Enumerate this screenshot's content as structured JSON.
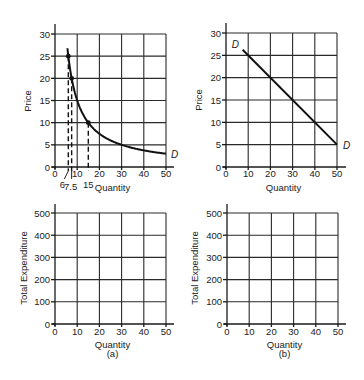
{
  "chart_data": [
    {
      "id": "top-a",
      "type": "line",
      "xlabel": "Quantity",
      "ylabel": "Price",
      "xlim": [
        0,
        50
      ],
      "ylim": [
        0,
        30
      ],
      "xticks": [
        "0",
        "10",
        "20",
        "30",
        "40",
        "50"
      ],
      "yticks": [
        "0",
        "5",
        "10",
        "15",
        "20",
        "25",
        "30"
      ],
      "grid": true,
      "series": [
        {
          "name": "D",
          "label": "D",
          "description": "P = 150 / Q",
          "x": [
            5.6,
            6,
            7.5,
            10,
            15,
            20,
            25,
            30,
            40,
            50
          ],
          "y": [
            26.8,
            25,
            20,
            15,
            10,
            7.5,
            6,
            5,
            3.75,
            3
          ]
        }
      ],
      "marked_points": [
        {
          "x": 6,
          "y": 25
        },
        {
          "x": 7.5,
          "y": 20
        },
        {
          "x": 15,
          "y": 10
        }
      ],
      "annotations": [
        "6",
        "7.5",
        "15"
      ]
    },
    {
      "id": "top-b",
      "type": "line",
      "xlabel": "Quantity",
      "ylabel": "Price",
      "xlim": [
        0,
        50
      ],
      "ylim": [
        0,
        30
      ],
      "xticks": [
        "0",
        "10",
        "20",
        "30",
        "40",
        "50"
      ],
      "yticks": [
        "0",
        "5",
        "10",
        "15",
        "20",
        "25",
        "30"
      ],
      "grid": true,
      "series": [
        {
          "name": "D",
          "label_start": "D",
          "label_end": "D",
          "description": "P = 30 - 0.5Q",
          "x": [
            7.5,
            50
          ],
          "y": [
            26.25,
            5
          ]
        }
      ]
    },
    {
      "id": "bottom-a",
      "type": "line",
      "xlabel": "Quantity",
      "sublabel": "(a)",
      "ylabel": "Total Expenditure",
      "xlim": [
        0,
        50
      ],
      "ylim": [
        0,
        500
      ],
      "xticks": [
        "0",
        "10",
        "20",
        "30",
        "40",
        "50"
      ],
      "yticks": [
        "0",
        "100",
        "200",
        "300",
        "400",
        "500"
      ],
      "grid": true,
      "series": []
    },
    {
      "id": "bottom-b",
      "type": "line",
      "xlabel": "Quantity",
      "sublabel": "(b)",
      "ylabel": "Total Expenditure",
      "xlim": [
        0,
        50
      ],
      "ylim": [
        0,
        500
      ],
      "xticks": [
        "0",
        "10",
        "20",
        "30",
        "40",
        "50"
      ],
      "yticks": [
        "0",
        "100",
        "200",
        "300",
        "400",
        "500"
      ],
      "grid": true,
      "series": []
    }
  ]
}
